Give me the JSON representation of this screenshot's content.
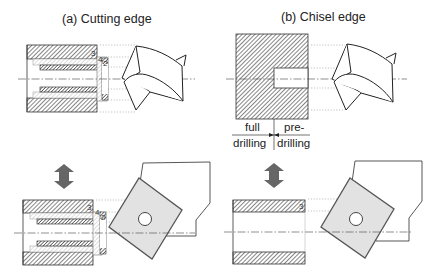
{
  "panels": {
    "a": {
      "title": "(a) Cutting edge",
      "layer_labels": [
        "3",
        "4",
        "2",
        "1"
      ]
    },
    "b": {
      "title": "(b) Chisel edge",
      "layer_labels": [
        "3"
      ]
    }
  },
  "dimension_labels": {
    "full": "full",
    "full_2": "drilling",
    "pre": "pre-",
    "pre_2": "drilling"
  },
  "colors": {
    "line": "#333333",
    "hatch": "#444444",
    "insert_fill": "#e2e2e2",
    "insert_stroke": "#555555",
    "arrow": "#666666",
    "dotted": "#999999"
  }
}
